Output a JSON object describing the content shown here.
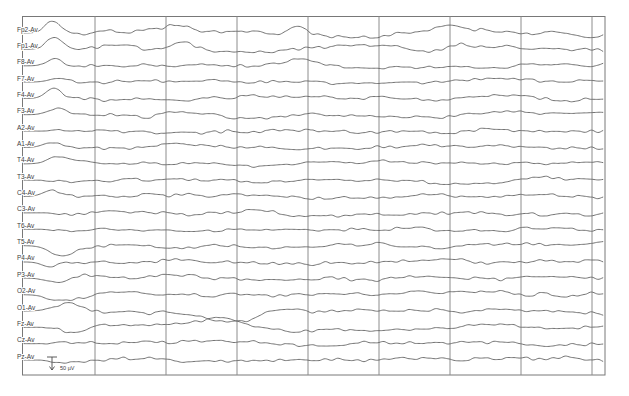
{
  "figure": {
    "kind": "eeg-trace-page",
    "scale_bar_label": "50 µV"
  },
  "chart_data": {
    "type": "line",
    "subtype": "eeg-multichannel",
    "title": "",
    "legend": "none",
    "grid": {
      "vlines_x": [
        95,
        166,
        237,
        308,
        379,
        450,
        521,
        592
      ],
      "border": {
        "left": 22.5,
        "top": 16.5,
        "right": 605,
        "bottom": 375
      }
    },
    "colors": {
      "background": "#ffffff",
      "trace": "#636363",
      "gridline": "#8c8c8c",
      "border": "#787878",
      "label": "#3c3c3c",
      "scale_marker": "#4a4a4a"
    },
    "layout": {
      "baseline_first_y": 33,
      "baseline_step_y": 16.35,
      "trace_x_start": 24,
      "trace_x_end": 603,
      "label_x": 17,
      "label_font_px": 6.5,
      "flat_leadin_end_x": 40,
      "sample_step_px": 1.25
    },
    "scale_bar": {
      "label": "50 µV",
      "x": 52,
      "top_y": 357,
      "height": 13,
      "text_x": 60,
      "text_y": 370,
      "text_font_px": 5.5
    },
    "note": "Waveforms are stochastic EEG traces; reproduced via seeded value-noise with per-channel amplitude/fast-activity factors and transient events (gaussian bumps, +a = upward deflection) estimated from the image.",
    "channels": [
      {
        "label": "Fp2-Av",
        "seed": 101,
        "amp": 6.0,
        "fast": 1.0,
        "bumps": [
          {
            "x": 52,
            "a": 12,
            "w": 7
          },
          {
            "x": 178,
            "a": 7,
            "w": 11
          },
          {
            "x": 300,
            "a": 6,
            "w": 10
          },
          {
            "x": 452,
            "a": 5,
            "w": 12
          }
        ]
      },
      {
        "label": "Fp1-Av",
        "seed": 102,
        "amp": 6.0,
        "fast": 1.0,
        "bumps": [
          {
            "x": 55,
            "a": 11,
            "w": 8
          },
          {
            "x": 182,
            "a": 7,
            "w": 11
          },
          {
            "x": 452,
            "a": 5,
            "w": 12
          }
        ]
      },
      {
        "label": "F8-Av",
        "seed": 103,
        "amp": 5.0,
        "fast": 1.0,
        "bumps": [
          {
            "x": 56,
            "a": 10,
            "w": 8
          },
          {
            "x": 300,
            "a": 5,
            "w": 11
          }
        ]
      },
      {
        "label": "F7-Av",
        "seed": 104,
        "amp": 4.5,
        "fast": 1.1,
        "bumps": [
          {
            "x": 60,
            "a": 5,
            "w": 9
          }
        ]
      },
      {
        "label": "F4-Av",
        "seed": 105,
        "amp": 5.0,
        "fast": 1.0,
        "bumps": [
          {
            "x": 54,
            "a": 10,
            "w": 8
          }
        ]
      },
      {
        "label": "F3-Av",
        "seed": 106,
        "amp": 5.0,
        "fast": 1.0,
        "bumps": [
          {
            "x": 57,
            "a": 7,
            "w": 9
          }
        ]
      },
      {
        "label": "A2-Av",
        "seed": 107,
        "amp": 3.2,
        "fast": 1.9,
        "bumps": []
      },
      {
        "label": "A1-Av",
        "seed": 108,
        "amp": 4.2,
        "fast": 1.2,
        "bumps": [
          {
            "x": 50,
            "a": 4,
            "w": 8
          }
        ]
      },
      {
        "label": "T4-Av",
        "seed": 109,
        "amp": 4.2,
        "fast": 1.0,
        "bumps": [
          {
            "x": 58,
            "a": 6,
            "w": 10
          }
        ]
      },
      {
        "label": "T3-Av",
        "seed": 110,
        "amp": 4.6,
        "fast": 1.2,
        "bumps": []
      },
      {
        "label": "C4-Av",
        "seed": 111,
        "amp": 4.8,
        "fast": 1.1,
        "bumps": [
          {
            "x": 52,
            "a": 6,
            "w": 9
          }
        ]
      },
      {
        "label": "C3-Av",
        "seed": 112,
        "amp": 4.6,
        "fast": 1.1,
        "bumps": []
      },
      {
        "label": "T6-Av",
        "seed": 113,
        "amp": 4.2,
        "fast": 1.1,
        "bumps": []
      },
      {
        "label": "T5-Av",
        "seed": 114,
        "amp": 5.0,
        "fast": 1.0,
        "bumps": [
          {
            "x": 62,
            "a": -9,
            "w": 12
          }
        ]
      },
      {
        "label": "P4-Av",
        "seed": 115,
        "amp": 5.0,
        "fast": 1.2,
        "bumps": [
          {
            "x": 50,
            "a": -5,
            "w": 8
          }
        ]
      },
      {
        "label": "P3-Av",
        "seed": 116,
        "amp": 4.8,
        "fast": 1.1,
        "bumps": [
          {
            "x": 58,
            "a": -6,
            "w": 10
          }
        ]
      },
      {
        "label": "O2-Av",
        "seed": 117,
        "amp": 5.0,
        "fast": 1.1,
        "bumps": [
          {
            "x": 60,
            "a": -6,
            "w": 12
          }
        ]
      },
      {
        "label": "O1-Av",
        "seed": 118,
        "amp": 5.5,
        "fast": 1.0,
        "bumps": [
          {
            "x": 70,
            "a": 8,
            "w": 14
          },
          {
            "x": 230,
            "a": -11,
            "w": 20
          }
        ]
      },
      {
        "label": "Fz-Av",
        "seed": 119,
        "amp": 5.0,
        "fast": 1.0,
        "bumps": [
          {
            "x": 75,
            "a": -6,
            "w": 12
          },
          {
            "x": 222,
            "a": 10,
            "w": 18
          }
        ]
      },
      {
        "label": "Cz-Av",
        "seed": 120,
        "amp": 3.4,
        "fast": 1.7,
        "bumps": []
      },
      {
        "label": "Pz-Av",
        "seed": 121,
        "amp": 4.0,
        "fast": 1.4,
        "bumps": []
      }
    ]
  }
}
